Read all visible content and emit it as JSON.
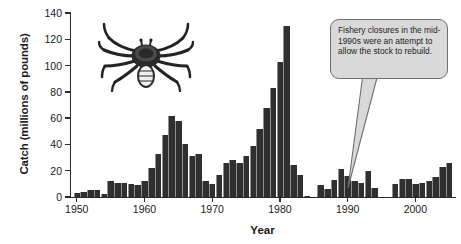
{
  "chart_data": {
    "type": "bar",
    "title": "",
    "subtitle": "",
    "xlabel": "Year",
    "ylabel": "Catch (millions of pounds)",
    "xlim": [
      1949,
      2006
    ],
    "ylim": [
      0,
      140
    ],
    "ytick_values": [
      0,
      20,
      40,
      60,
      80,
      100,
      120,
      140
    ],
    "ytick_labels": [
      "0",
      "20",
      "40",
      "60",
      "80",
      "100",
      "120",
      "140"
    ],
    "xtick_values": [
      1950,
      1960,
      1970,
      1980,
      1990,
      2000
    ],
    "xtick_labels": [
      "1950",
      "1960",
      "1970",
      "1980",
      "1990",
      "2000"
    ],
    "grid": false,
    "legend": null,
    "bar_color": "#2f2f2f",
    "categories": [
      1950,
      1951,
      1952,
      1953,
      1954,
      1955,
      1956,
      1957,
      1958,
      1959,
      1960,
      1961,
      1962,
      1963,
      1964,
      1965,
      1966,
      1967,
      1968,
      1969,
      1970,
      1971,
      1972,
      1973,
      1974,
      1975,
      1976,
      1977,
      1978,
      1979,
      1980,
      1981,
      1982,
      1983,
      1984,
      1985,
      1986,
      1987,
      1988,
      1989,
      1990,
      1991,
      1992,
      1993,
      1994,
      1995,
      1996,
      1997,
      1998,
      1999,
      2000,
      2001,
      2002,
      2003,
      2004,
      2005
    ],
    "values": [
      3,
      4,
      5,
      5,
      2,
      12,
      11,
      11,
      10,
      9,
      12,
      22,
      33,
      47,
      62,
      58,
      40,
      31,
      33,
      12,
      10,
      17,
      26,
      28,
      26,
      31,
      39,
      52,
      68,
      83,
      103,
      130,
      24,
      17,
      1,
      0,
      9,
      6,
      13,
      21,
      16,
      12,
      11,
      20,
      7,
      0,
      0,
      10,
      14,
      14,
      10,
      11,
      12,
      15,
      23,
      26
    ],
    "data_gap_years": [
      1995,
      1996
    ],
    "annotations": [
      {
        "text": "Fishery closures in the mid-1990s were an attempt to allow the stock to rebuild.",
        "points_to_year": 1995,
        "style": "rounded-callout",
        "fill": "#d9d9d9",
        "stroke": "#6e6e6e"
      }
    ],
    "decorations": [
      {
        "name": "king-crab-illustration",
        "position": "upper-left-plot-area"
      }
    ]
  },
  "axes": {
    "y_title": "Catch (millions of pounds)",
    "x_title": "Year"
  },
  "callout": {
    "text": "Fishery closures in the mid-1990s were an attempt to allow the stock to rebuild."
  }
}
